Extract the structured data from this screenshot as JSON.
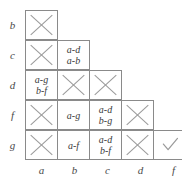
{
  "figure": {
    "type": "lower-triangular-comparison-matrix",
    "row_labels": [
      "b",
      "c",
      "d",
      "f",
      "g"
    ],
    "col_labels": [
      "a",
      "b",
      "c",
      "d",
      "f"
    ],
    "colors": {
      "grid_line": "#8a8a8a",
      "mark": "#9a9a9a",
      "text": "#3a3a3a",
      "label": "#4a4a4a",
      "background": "#ffffff"
    },
    "marks": {
      "cross": "x-mark",
      "check": "check-mark"
    },
    "rows": [
      {
        "label": "b",
        "cells": [
          {
            "kind": "cross",
            "lines": []
          }
        ]
      },
      {
        "label": "c",
        "cells": [
          {
            "kind": "cross",
            "lines": []
          },
          {
            "kind": "text",
            "lines": [
              "a-d",
              "a-b"
            ]
          }
        ]
      },
      {
        "label": "d",
        "cells": [
          {
            "kind": "text",
            "lines": [
              "a-g",
              "b-f"
            ]
          },
          {
            "kind": "cross",
            "lines": []
          },
          {
            "kind": "cross",
            "lines": []
          }
        ]
      },
      {
        "label": "f",
        "cells": [
          {
            "kind": "cross",
            "lines": []
          },
          {
            "kind": "text",
            "lines": [
              "a-g"
            ]
          },
          {
            "kind": "text",
            "lines": [
              "a-d",
              "b-g"
            ]
          },
          {
            "kind": "cross",
            "lines": []
          }
        ]
      },
      {
        "label": "g",
        "cells": [
          {
            "kind": "cross",
            "lines": []
          },
          {
            "kind": "text",
            "lines": [
              "a-f"
            ]
          },
          {
            "kind": "text",
            "lines": [
              "a-d",
              "b-f"
            ]
          },
          {
            "kind": "cross",
            "lines": []
          },
          {
            "kind": "check",
            "lines": []
          }
        ]
      }
    ]
  }
}
